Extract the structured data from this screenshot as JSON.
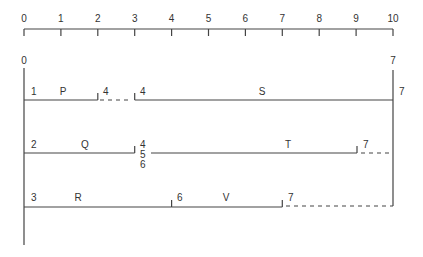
{
  "scale": {
    "ticks": [
      "0",
      "1",
      "2",
      "3",
      "4",
      "5",
      "6",
      "7",
      "8",
      "9",
      "10"
    ],
    "min": 0,
    "max": 10
  },
  "network": {
    "start_node_label": "0",
    "end_node_label": "7",
    "rows": [
      {
        "activities": [
          {
            "name": "P",
            "from_node": "1",
            "start": 0,
            "end": 2,
            "to_node": "4"
          },
          {
            "name": "S",
            "from_node": "4",
            "start": 3,
            "end": 10,
            "to_node": "7"
          }
        ],
        "floats": [
          {
            "start": 2,
            "end": 3
          }
        ]
      },
      {
        "activities": [
          {
            "name": "Q",
            "from_node": "2",
            "start": 0,
            "end": 3,
            "to_node": "4\n5\n6"
          },
          {
            "name": "T",
            "from_node": "",
            "start": 3,
            "end": 9,
            "to_node": "7"
          }
        ],
        "floats": [
          {
            "start": 9,
            "end": 10
          }
        ]
      },
      {
        "activities": [
          {
            "name": "R",
            "from_node": "3",
            "start": 0,
            "end": 4,
            "to_node": "6"
          },
          {
            "name": "V",
            "from_node": "",
            "start": 4,
            "end": 7,
            "to_node": "7"
          }
        ],
        "floats": [
          {
            "start": 7,
            "end": 10
          }
        ]
      }
    ],
    "labels": {
      "row1": {
        "n1": "1",
        "a1": "P",
        "n2": "4",
        "n3": "4",
        "a2": "S",
        "n4": "7"
      },
      "row2": {
        "n1": "2",
        "a1": "Q",
        "n2a": "4",
        "n2b": "5",
        "n2c": "6",
        "a2": "T",
        "n3": "7"
      },
      "row3": {
        "n1": "3",
        "a1": "R",
        "n2": "6",
        "a2": "V",
        "n3": "7"
      }
    }
  }
}
